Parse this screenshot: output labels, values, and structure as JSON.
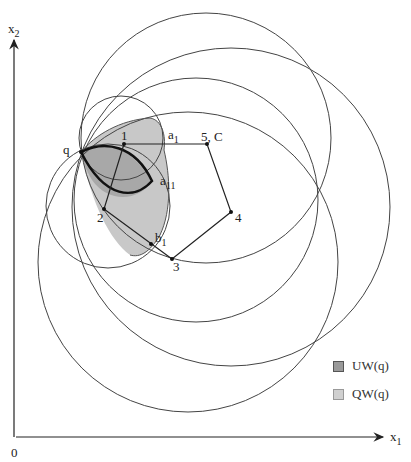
{
  "axes": {
    "x_label": "x",
    "x_sub": "1",
    "y_label": "x",
    "y_sub": "2",
    "origin_label": "0"
  },
  "points": {
    "q": "q",
    "p1": "1",
    "p2": "2",
    "p3": "3",
    "p4": "4",
    "p5": "5, C",
    "a1": "a",
    "a1_sub": "1",
    "a11": "a",
    "a11_sub": "11",
    "b1": "b",
    "b1_sub": "1"
  },
  "legend": {
    "items": [
      {
        "label": "UW(q)",
        "color": "#9a9a9a"
      },
      {
        "label": "QW(q)",
        "color": "#d0d0d0"
      }
    ]
  }
}
